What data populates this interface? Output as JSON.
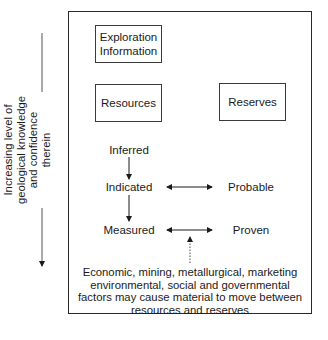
{
  "diagram": {
    "boxes": {
      "exploration": "Exploration\nInformation",
      "exploration_lines": [
        "Exploration",
        "Information"
      ],
      "resources": "Resources",
      "reserves": "Reserves"
    },
    "resource_categories": [
      "Inferred",
      "Indicated",
      "Measured"
    ],
    "reserve_categories": [
      "Probable",
      "Proven"
    ],
    "side_axis": {
      "lines": [
        "Increasing level of",
        "geological knowledge",
        "and confidence",
        "therein"
      ],
      "direction": "down"
    },
    "note": {
      "lines": [
        "Economic, mining, metallurgical, marketing",
        "environmental, social and governmental",
        "factors may cause material to move between",
        "resources and reserves"
      ]
    },
    "relationships": [
      {
        "from": "Inferred",
        "to": "Indicated",
        "type": "one-way"
      },
      {
        "from": "Indicated",
        "to": "Measured",
        "type": "one-way"
      },
      {
        "from": "Indicated",
        "to": "Probable",
        "type": "two-way"
      },
      {
        "from": "Measured",
        "to": "Proven",
        "type": "two-way"
      },
      {
        "from": "modifying factors note",
        "to": "Measured-Proven link",
        "type": "dotted"
      }
    ],
    "colors": {
      "line": "#2a2a2a",
      "text": "#1a1a1a",
      "background": "#ffffff"
    }
  }
}
